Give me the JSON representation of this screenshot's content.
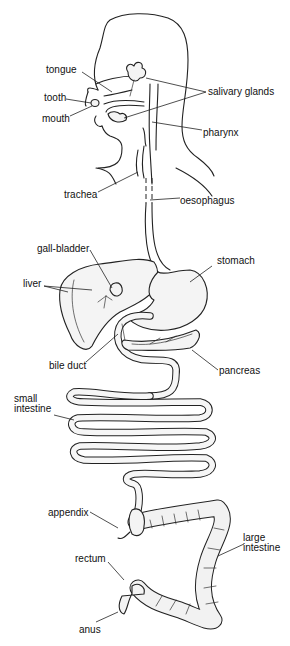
{
  "diagram": {
    "labels": {
      "tongue": "tongue",
      "tooth": "tooth",
      "mouth": "mouth",
      "salivary_glands": "salivary glands",
      "pharynx": "pharynx",
      "trachea": "trachea",
      "oesophagus": "oesophagus",
      "gall_bladder": "gall-bladder",
      "stomach": "stomach",
      "liver": "liver",
      "bile_duct": "bile duct",
      "pancreas": "pancreas",
      "small_intestine_line1": "small",
      "small_intestine_line2": "intestine",
      "appendix": "appendix",
      "large_intestine_line1": "large",
      "large_intestine_line2": "intestine",
      "rectum": "rectum",
      "anus": "anus"
    },
    "colors": {
      "line": "#222222",
      "organ_fill": "#f4f4f4",
      "background": "#ffffff"
    }
  }
}
